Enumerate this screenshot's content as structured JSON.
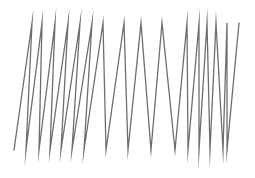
{
  "figure": {
    "type": "zigzag-polyline",
    "stroke_color": "#6e6e6e",
    "stroke_width": 1.3,
    "points": [
      [
        14,
        150
      ],
      [
        32,
        23
      ],
      [
        26,
        150
      ],
      [
        42,
        23
      ],
      [
        39,
        150
      ],
      [
        55,
        23
      ],
      [
        50,
        150
      ],
      [
        68,
        23
      ],
      [
        61,
        150
      ],
      [
        80,
        23
      ],
      [
        72,
        150
      ],
      [
        92,
        23
      ],
      [
        84,
        150
      ],
      [
        103,
        23
      ],
      [
        106,
        150
      ],
      [
        124,
        23
      ],
      [
        128,
        150
      ],
      [
        141,
        23
      ],
      [
        151,
        150
      ],
      [
        162,
        23
      ],
      [
        175,
        150
      ],
      [
        187,
        23
      ],
      [
        188,
        150
      ],
      [
        199,
        23
      ],
      [
        199,
        150
      ],
      [
        207,
        23
      ],
      [
        210,
        150
      ],
      [
        216,
        23
      ],
      [
        223,
        150
      ],
      [
        227,
        23
      ],
      [
        227,
        150
      ],
      [
        239,
        23
      ]
    ]
  }
}
